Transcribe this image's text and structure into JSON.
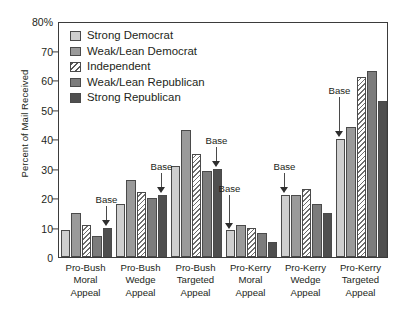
{
  "chart_data": {
    "type": "bar",
    "title": "",
    "xlabel": "",
    "ylabel": "Percent of Mail Received",
    "ylim": [
      0,
      80
    ],
    "yticks": [
      "0",
      "10",
      "20",
      "30",
      "40",
      "50",
      "60",
      "70",
      "80%"
    ],
    "grid": false,
    "legend_position": "top-left",
    "categories": [
      "Pro-Bush Moral Appeal",
      "Pro-Bush Wedge Appeal",
      "Pro-Bush Targeted Appeal",
      "Pro-Kerry Moral Appeal",
      "Pro-Kerry Wedge Appeal",
      "Pro-Kerry Targeted Appeal"
    ],
    "category_lines": [
      [
        "Pro-Bush",
        "Moral",
        "Appeal"
      ],
      [
        "Pro-Bush",
        "Wedge",
        "Appeal"
      ],
      [
        "Pro-Bush",
        "Targeted",
        "Appeal"
      ],
      [
        "Pro-Kerry",
        "Moral",
        "Appeal"
      ],
      [
        "Pro-Kerry",
        "Wedge",
        "Appeal"
      ],
      [
        "Pro-Kerry",
        "Targeted",
        "Appeal"
      ]
    ],
    "series": [
      {
        "name": "Strong Democrat",
        "values": [
          9,
          18,
          31,
          9,
          21,
          40
        ]
      },
      {
        "name": "Weak/Lean Democrat",
        "values": [
          15,
          26,
          43,
          11,
          21,
          44
        ]
      },
      {
        "name": "Independent",
        "values": [
          11,
          22,
          35,
          10,
          23,
          61
        ]
      },
      {
        "name": "Weak/Lean Republican",
        "values": [
          7,
          20,
          29,
          8,
          18,
          63
        ]
      },
      {
        "name": "Strong Republican",
        "values": [
          10,
          21,
          30,
          5,
          15,
          53
        ]
      }
    ],
    "annotations": [
      {
        "label": "Base",
        "group": 0,
        "series": 4
      },
      {
        "label": "Base",
        "group": 1,
        "series": 4
      },
      {
        "label": "Base",
        "group": 2,
        "series": 4
      },
      {
        "label": "Base",
        "group": 3,
        "series": 0
      },
      {
        "label": "Base",
        "group": 4,
        "series": 0
      },
      {
        "label": "Base",
        "group": 5,
        "series": 0
      }
    ]
  },
  "legend": {
    "items": [
      {
        "label": "Strong Democrat",
        "swatch": "light-grey-solid"
      },
      {
        "label": "Weak/Lean Democrat",
        "swatch": "mid-grey-solid"
      },
      {
        "label": "Independent",
        "swatch": "diagonal-hatch"
      },
      {
        "label": "Weak/Lean Republican",
        "swatch": "dark-grey-solid"
      },
      {
        "label": "Strong Republican",
        "swatch": "darkest-grey-solid"
      }
    ]
  },
  "colors": {
    "strong_democrat": "#cfcfcf",
    "weak_lean_democrat": "#9a9a9a",
    "independent": "#ffffff",
    "weak_lean_republican": "#7c7c7c",
    "strong_republican": "#4f4f4f",
    "axis": "#3b3b3b",
    "text": "#231f20",
    "background": "#ffffff"
  }
}
